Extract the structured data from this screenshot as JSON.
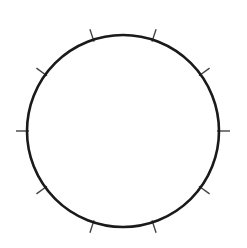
{
  "diagram": {
    "type": "circle-with-ticks",
    "center": [
      123,
      131
    ],
    "radius": 96,
    "tick_count": 10,
    "tick_angles_deg": [
      0,
      36,
      72,
      108,
      144,
      180,
      216,
      252,
      288,
      324
    ],
    "tick_length_outside": 11,
    "circle_stroke": "#1a1a1a",
    "tick_stroke": "#444444"
  }
}
